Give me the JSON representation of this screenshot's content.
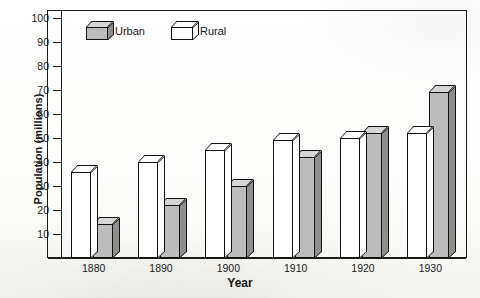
{
  "chart_data": {
    "type": "bar",
    "title": "",
    "xlabel": "Year",
    "ylabel": "Population (millions)",
    "categories": [
      "1880",
      "1890",
      "1900",
      "1910",
      "1920",
      "1930"
    ],
    "series": [
      {
        "name": "Rural",
        "values": [
          36,
          40,
          45,
          49,
          50,
          52
        ],
        "color": "#ffffff"
      },
      {
        "name": "Urban",
        "values": [
          14,
          22,
          30,
          42,
          52,
          69
        ],
        "color": "#bcbcbc"
      }
    ],
    "series_draw_order": [
      "Rural",
      "Urban"
    ],
    "ylim": [
      0,
      100
    ],
    "ytick_values": [
      10,
      20,
      30,
      40,
      50,
      60,
      70,
      80,
      90,
      100
    ],
    "ytick_labels": [
      "10",
      "20",
      "30",
      "40",
      "50",
      "60",
      "70",
      "80",
      "90",
      "100"
    ],
    "grid": false,
    "legend_position": "top-left-inside",
    "style": "3d-blocks"
  },
  "legend": {
    "items": [
      {
        "label": "Urban",
        "swatch": "gray-cube-icon"
      },
      {
        "label": "Rural",
        "swatch": "white-cube-icon"
      }
    ]
  },
  "axes": {
    "y_title": "Population (millions)",
    "x_title": "Year"
  }
}
